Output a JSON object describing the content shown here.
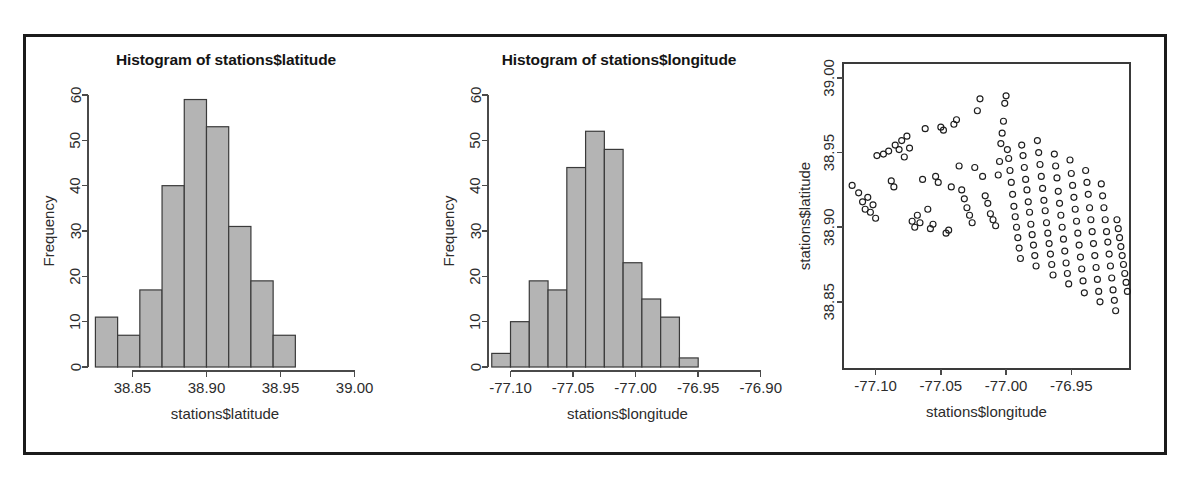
{
  "figure": {
    "border_color": "#1b1b1b",
    "background": "#ffffff",
    "bar_fill": "#b4b4b4",
    "bar_stroke": "#3a3a3a",
    "point_stroke": "#1d1d1d"
  },
  "panels": {
    "hist_latitude": {
      "title": "Histogram of stations$latitude",
      "xlabel": "stations$latitude",
      "ylabel": "Frequency"
    },
    "hist_longitude": {
      "title": "Histogram of stations$longitude",
      "xlabel": "stations$longitude",
      "ylabel": "Frequency"
    },
    "scatter": {
      "xlabel": "stations$longitude",
      "ylabel": "stations$latitude"
    }
  },
  "chart_data": [
    {
      "type": "bar",
      "title": "Histogram of stations$latitude",
      "xlabel": "stations$latitude",
      "ylabel": "Frequency",
      "bin_edges": [
        38.825,
        38.84,
        38.855,
        38.87,
        38.885,
        38.9,
        38.915,
        38.93,
        38.945,
        38.96
      ],
      "categories": [
        "38.825-38.840",
        "38.840-38.855",
        "38.855-38.870",
        "38.870-38.885",
        "38.885-38.900",
        "38.900-38.915",
        "38.915-38.930",
        "38.930-38.945",
        "38.945-38.960"
      ],
      "values": [
        11,
        7,
        17,
        40,
        59,
        53,
        31,
        19,
        7
      ],
      "xticks": [
        "38.85",
        "38.90",
        "38.95",
        "39.00"
      ],
      "xtick_values": [
        38.85,
        38.9,
        38.95,
        39.0
      ],
      "yticks": [
        "0",
        "10",
        "20",
        "30",
        "40",
        "50",
        "60"
      ],
      "ytick_values": [
        0,
        10,
        20,
        30,
        40,
        50,
        60
      ],
      "xlim": [
        38.82,
        39.005
      ],
      "ylim": [
        0,
        60
      ],
      "grid": false,
      "legend": false
    },
    {
      "type": "bar",
      "title": "Histogram of stations$longitude",
      "xlabel": "stations$longitude",
      "ylabel": "Frequency",
      "bin_edges": [
        -77.115,
        -77.1,
        -77.085,
        -77.07,
        -77.055,
        -77.04,
        -77.025,
        -77.01,
        -76.995,
        -76.98,
        -76.965,
        -76.95
      ],
      "categories": [
        "-77.115--77.100",
        "-77.100--77.085",
        "-77.085--77.070",
        "-77.070--77.055",
        "-77.055--77.040",
        "-77.040--77.025",
        "-77.025--77.010",
        "-77.010--76.995",
        "-76.995--76.980",
        "-76.980--76.965",
        "-76.965--76.950"
      ],
      "values": [
        3,
        10,
        19,
        17,
        44,
        52,
        48,
        23,
        15,
        11,
        2
      ],
      "xticks": [
        "-77.10",
        "-77.05",
        "-77.00",
        "-76.95",
        "-76.90"
      ],
      "xtick_values": [
        -77.1,
        -77.05,
        -77.0,
        -76.95,
        -76.9
      ],
      "yticks": [
        "0",
        "10",
        "20",
        "30",
        "40",
        "50",
        "60"
      ],
      "ytick_values": [
        0,
        10,
        20,
        30,
        40,
        50,
        60
      ],
      "xlim": [
        -77.118,
        -76.895
      ],
      "ylim": [
        0,
        60
      ],
      "grid": false,
      "legend": false
    },
    {
      "type": "scatter",
      "title": "",
      "xlabel": "stations$longitude",
      "ylabel": "stations$latitude",
      "xticks": [
        "-77.10",
        "-77.05",
        "-77.00",
        "-76.95"
      ],
      "xtick_values": [
        -77.1,
        -77.05,
        -77.0,
        -76.95
      ],
      "yticks": [
        "38.85",
        "38.90",
        "38.95",
        "39.00"
      ],
      "ytick_values": [
        38.85,
        38.9,
        38.95,
        39.0
      ],
      "xlim": [
        -77.125,
        -76.905
      ],
      "ylim": [
        38.805,
        39.01
      ],
      "grid": false,
      "legend": false,
      "marker": "open-circle",
      "points": [
        [
          -77.118,
          38.928
        ],
        [
          -77.113,
          38.923
        ],
        [
          -77.11,
          38.917
        ],
        [
          -77.108,
          38.912
        ],
        [
          -77.106,
          38.92
        ],
        [
          -77.104,
          38.91
        ],
        [
          -77.102,
          38.915
        ],
        [
          -77.1,
          38.906
        ],
        [
          -77.099,
          38.948
        ],
        [
          -77.094,
          38.949
        ],
        [
          -77.09,
          38.951
        ],
        [
          -77.088,
          38.931
        ],
        [
          -77.086,
          38.927
        ],
        [
          -77.085,
          38.955
        ],
        [
          -77.082,
          38.952
        ],
        [
          -77.08,
          38.958
        ],
        [
          -77.078,
          38.947
        ],
        [
          -77.076,
          38.961
        ],
        [
          -77.074,
          38.953
        ],
        [
          -77.072,
          38.904
        ],
        [
          -77.07,
          38.9
        ],
        [
          -77.068,
          38.908
        ],
        [
          -77.066,
          38.903
        ],
        [
          -77.064,
          38.932
        ],
        [
          -77.062,
          38.966
        ],
        [
          -77.06,
          38.912
        ],
        [
          -77.058,
          38.899
        ],
        [
          -77.056,
          38.902
        ],
        [
          -77.054,
          38.934
        ],
        [
          -77.052,
          38.93
        ],
        [
          -77.05,
          38.967
        ],
        [
          -77.048,
          38.965
        ],
        [
          -77.046,
          38.896
        ],
        [
          -77.044,
          38.898
        ],
        [
          -77.042,
          38.927
        ],
        [
          -77.04,
          38.969
        ],
        [
          -77.038,
          38.972
        ],
        [
          -77.036,
          38.941
        ],
        [
          -77.034,
          38.925
        ],
        [
          -77.032,
          38.919
        ],
        [
          -77.03,
          38.913
        ],
        [
          -77.028,
          38.908
        ],
        [
          -77.026,
          38.903
        ],
        [
          -77.024,
          38.94
        ],
        [
          -77.022,
          38.978
        ],
        [
          -77.02,
          38.986
        ],
        [
          -77.018,
          38.934
        ],
        [
          -77.016,
          38.921
        ],
        [
          -77.014,
          38.916
        ],
        [
          -77.012,
          38.909
        ],
        [
          -77.01,
          38.905
        ],
        [
          -77.008,
          38.901
        ],
        [
          -77.006,
          38.935
        ],
        [
          -77.005,
          38.944
        ],
        [
          -77.004,
          38.956
        ],
        [
          -77.003,
          38.963
        ],
        [
          -77.002,
          38.971
        ],
        [
          -77.001,
          38.983
        ],
        [
          -77.0,
          38.988
        ],
        [
          -76.999,
          38.952
        ],
        [
          -76.998,
          38.946
        ],
        [
          -76.997,
          38.938
        ],
        [
          -76.996,
          38.93
        ],
        [
          -76.995,
          38.922
        ],
        [
          -76.994,
          38.914
        ],
        [
          -76.993,
          38.907
        ],
        [
          -76.992,
          38.9
        ],
        [
          -76.991,
          38.893
        ],
        [
          -76.99,
          38.886
        ],
        [
          -76.989,
          38.879
        ],
        [
          -76.988,
          38.955
        ],
        [
          -76.987,
          38.948
        ],
        [
          -76.986,
          38.94
        ],
        [
          -76.985,
          38.932
        ],
        [
          -76.984,
          38.925
        ],
        [
          -76.983,
          38.917
        ],
        [
          -76.982,
          38.91
        ],
        [
          -76.981,
          38.902
        ],
        [
          -76.98,
          38.895
        ],
        [
          -76.979,
          38.888
        ],
        [
          -76.978,
          38.881
        ],
        [
          -76.977,
          38.874
        ],
        [
          -76.976,
          38.958
        ],
        [
          -76.975,
          38.95
        ],
        [
          -76.974,
          38.942
        ],
        [
          -76.973,
          38.934
        ],
        [
          -76.972,
          38.926
        ],
        [
          -76.971,
          38.918
        ],
        [
          -76.97,
          38.911
        ],
        [
          -76.969,
          38.903
        ],
        [
          -76.968,
          38.896
        ],
        [
          -76.967,
          38.889
        ],
        [
          -76.966,
          38.882
        ],
        [
          -76.965,
          38.875
        ],
        [
          -76.964,
          38.868
        ],
        [
          -76.963,
          38.949
        ],
        [
          -76.962,
          38.941
        ],
        [
          -76.961,
          38.933
        ],
        [
          -76.96,
          38.924
        ],
        [
          -76.959,
          38.916
        ],
        [
          -76.958,
          38.908
        ],
        [
          -76.957,
          38.9
        ],
        [
          -76.956,
          38.892
        ],
        [
          -76.955,
          38.884
        ],
        [
          -76.954,
          38.876
        ],
        [
          -76.953,
          38.869
        ],
        [
          -76.952,
          38.862
        ],
        [
          -76.951,
          38.945
        ],
        [
          -76.95,
          38.936
        ],
        [
          -76.949,
          38.928
        ],
        [
          -76.948,
          38.92
        ],
        [
          -76.947,
          38.912
        ],
        [
          -76.946,
          38.904
        ],
        [
          -76.945,
          38.896
        ],
        [
          -76.944,
          38.888
        ],
        [
          -76.943,
          38.88
        ],
        [
          -76.942,
          38.872
        ],
        [
          -76.941,
          38.864
        ],
        [
          -76.94,
          38.856
        ],
        [
          -76.939,
          38.938
        ],
        [
          -76.938,
          38.93
        ],
        [
          -76.937,
          38.922
        ],
        [
          -76.936,
          38.913
        ],
        [
          -76.935,
          38.905
        ],
        [
          -76.934,
          38.897
        ],
        [
          -76.933,
          38.889
        ],
        [
          -76.932,
          38.881
        ],
        [
          -76.931,
          38.873
        ],
        [
          -76.93,
          38.865
        ],
        [
          -76.929,
          38.857
        ],
        [
          -76.928,
          38.85
        ],
        [
          -76.927,
          38.929
        ],
        [
          -76.926,
          38.921
        ],
        [
          -76.925,
          38.913
        ],
        [
          -76.924,
          38.905
        ],
        [
          -76.923,
          38.897
        ],
        [
          -76.922,
          38.89
        ],
        [
          -76.921,
          38.882
        ],
        [
          -76.92,
          38.874
        ],
        [
          -76.919,
          38.866
        ],
        [
          -76.918,
          38.858
        ],
        [
          -76.917,
          38.851
        ],
        [
          -76.916,
          38.844
        ],
        [
          -76.915,
          38.905
        ],
        [
          -76.914,
          38.899
        ],
        [
          -76.913,
          38.893
        ],
        [
          -76.912,
          38.887
        ],
        [
          -76.911,
          38.881
        ],
        [
          -76.91,
          38.875
        ],
        [
          -76.909,
          38.869
        ],
        [
          -76.908,
          38.863
        ],
        [
          -76.907,
          38.857
        ]
      ]
    }
  ]
}
